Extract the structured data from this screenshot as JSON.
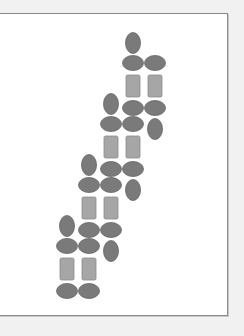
{
  "diagram": {
    "colors": {
      "ellipse_fill": "#7a7a7a",
      "ellipse_stroke": "#666666",
      "rect_fill": "#a6a6a6",
      "rect_stroke": "#8c8c8c",
      "frame_border": "#8a8a8a",
      "background": "#f1f1f1"
    },
    "groups": [
      {
        "name": "group-1",
        "column": 3,
        "row": 0
      },
      {
        "name": "group-2",
        "column": 2,
        "row": 1
      },
      {
        "name": "group-3",
        "column": 1,
        "row": 2
      },
      {
        "name": "group-4",
        "column": 0,
        "row": 3
      }
    ],
    "group_items": [
      {
        "shape": "ellipse",
        "orientation": "vertical",
        "slot": "top",
        "col": 0
      },
      {
        "shape": "ellipse",
        "orientation": "horizontal",
        "slot": "upper-row",
        "col": 0
      },
      {
        "shape": "ellipse",
        "orientation": "horizontal",
        "slot": "upper-row",
        "col": 1
      },
      {
        "shape": "rect",
        "slot": "middle",
        "col": 0
      },
      {
        "shape": "rect",
        "slot": "middle",
        "col": 1
      },
      {
        "shape": "ellipse",
        "orientation": "horizontal",
        "slot": "lower-row",
        "col": 0
      },
      {
        "shape": "ellipse",
        "orientation": "horizontal",
        "slot": "lower-row",
        "col": 1
      },
      {
        "shape": "ellipse",
        "orientation": "vertical",
        "slot": "bottom",
        "col": 1
      }
    ],
    "last_group_omits": [
      "bottom"
    ]
  }
}
